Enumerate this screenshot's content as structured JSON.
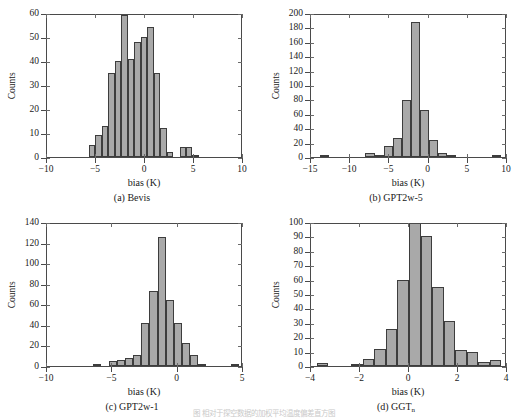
{
  "figure": {
    "bottom_caption": "图                  相对于探空数据的加权平均温度偏差直方图",
    "shared": {
      "xlabel": "bias (K)",
      "ylabel": "Counts",
      "bar_fill": "#a9a9a9",
      "bar_edge": "#3d3d3d",
      "axis_color": "#4a4a4a"
    }
  },
  "panels": [
    {
      "caption": "(a) Bevis",
      "caption_main": "(a) Bevis",
      "caption_sub": ""
    },
    {
      "caption": "(b) GPT2w-5",
      "caption_main": "(b) GPT2w-5",
      "caption_sub": ""
    },
    {
      "caption": "(c) GPT2w-1",
      "caption_main": "(c) GPT2w-1",
      "caption_sub": ""
    },
    {
      "caption": "(d) GGTn",
      "caption_main": "(d) GGT",
      "caption_sub": "n"
    }
  ],
  "chart_data": [
    {
      "type": "bar",
      "panel": "a",
      "title": "(a) Bevis",
      "xlabel": "bias (K)",
      "ylabel": "Counts",
      "xlim": [
        -10,
        10
      ],
      "ylim": [
        0,
        60
      ],
      "xticks": [
        -10,
        -5,
        0,
        5,
        10
      ],
      "yticks": [
        0,
        10,
        20,
        30,
        40,
        50,
        60
      ],
      "xticklabels": [
        "-10",
        "-5",
        "0",
        "5",
        "10"
      ],
      "yticklabels": [
        "0",
        "10",
        "20",
        "30",
        "40",
        "50",
        "60"
      ],
      "grid": false,
      "legend": null,
      "bin_width": 0.66,
      "bin_starts": [
        -5.72,
        -5.06,
        -4.4,
        -3.74,
        -3.08,
        -2.42,
        -1.76,
        -1.1,
        -0.44,
        0.22,
        0.88,
        1.54,
        2.2,
        2.86,
        3.52,
        4.18,
        4.84,
        5.5,
        6.16,
        6.82,
        7.48
      ],
      "values": [
        5,
        9,
        13,
        35,
        40,
        59,
        41,
        48,
        50,
        54,
        35,
        12,
        2,
        0,
        4,
        4,
        1,
        0,
        0,
        0,
        0
      ]
    },
    {
      "type": "bar",
      "panel": "b",
      "title": "(b) GPT2w-5",
      "xlabel": "bias (K)",
      "ylabel": "Counts",
      "xlim": [
        -15,
        10
      ],
      "ylim": [
        0,
        200
      ],
      "xticks": [
        -15,
        -10,
        -5,
        0,
        5,
        10
      ],
      "yticks": [
        0,
        20,
        40,
        60,
        80,
        100,
        120,
        140,
        160,
        180,
        200
      ],
      "xticklabels": [
        "-15",
        "-10",
        "-5",
        "0",
        "5",
        "10"
      ],
      "yticklabels": [
        "0",
        "20",
        "40",
        "60",
        "80",
        "100",
        "120",
        "140",
        "160",
        "180",
        "200"
      ],
      "grid": false,
      "legend": null,
      "bin_width": 1.15,
      "bin_starts": [
        -13.8,
        -8.05,
        -6.9,
        -5.75,
        -4.6,
        -3.45,
        -2.3,
        -1.15,
        0,
        1.15,
        2.3,
        3.45,
        8.05
      ],
      "values": [
        1,
        5,
        3,
        15,
        26,
        79,
        187,
        65,
        23,
        5,
        1,
        0,
        1
      ]
    },
    {
      "type": "bar",
      "panel": "c",
      "title": "(c) GPT2w-1",
      "xlabel": "bias (K)",
      "ylabel": "Counts",
      "xlim": [
        -10,
        5
      ],
      "ylim": [
        0,
        140
      ],
      "xticks": [
        -10,
        -5,
        0,
        5
      ],
      "yticks": [
        0,
        20,
        40,
        60,
        80,
        100,
        120,
        140
      ],
      "xticklabels": [
        "-10",
        "-5",
        "0",
        "5"
      ],
      "yticklabels": [
        "0",
        "20",
        "40",
        "60",
        "80",
        "100",
        "120",
        "140"
      ],
      "grid": false,
      "legend": null,
      "bin_width": 0.62,
      "bin_starts": [
        -6.5,
        -5.26,
        -4.64,
        -4.02,
        -3.4,
        -2.78,
        -2.16,
        -1.54,
        -0.92,
        -0.3,
        0.32,
        0.94,
        1.56,
        2.18,
        4.06
      ],
      "values": [
        2,
        5,
        6,
        8,
        11,
        42,
        73,
        125,
        64,
        42,
        22,
        11,
        1,
        0,
        1
      ]
    },
    {
      "type": "bar",
      "panel": "d",
      "title": "(d) GGTn",
      "xlabel": "bias (K)",
      "ylabel": "Counts",
      "xlim": [
        -4,
        4
      ],
      "ylim": [
        0,
        100
      ],
      "xticks": [
        -4,
        -2,
        0,
        2,
        4
      ],
      "yticks": [
        0,
        10,
        20,
        30,
        40,
        50,
        60,
        70,
        80,
        90,
        100
      ],
      "xticklabels": [
        "-4",
        "-2",
        "0",
        "2",
        "4"
      ],
      "yticklabels": [
        "0",
        "10",
        "20",
        "30",
        "40",
        "50",
        "60",
        "70",
        "80",
        "90",
        "100"
      ],
      "grid": false,
      "legend": null,
      "bin_width": 0.47,
      "bin_starts": [
        -3.76,
        -3.29,
        -2.82,
        -2.35,
        -1.88,
        -1.41,
        -0.94,
        -0.47,
        0,
        0.47,
        0.94,
        1.41,
        1.88,
        2.35,
        2.82,
        3.29
      ],
      "values": [
        2,
        0,
        0,
        1,
        5,
        12,
        26,
        60,
        103,
        90,
        55,
        31,
        11,
        10,
        3,
        4
      ],
      "note": "center bin is clipped by the y-axis top (exceeds 100)"
    }
  ]
}
